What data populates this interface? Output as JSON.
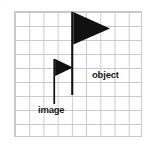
{
  "figure": {
    "background_color": "#ffffff",
    "width": 152,
    "height": 143
  },
  "grid": {
    "name": "graph-paper-grid",
    "columns": 9,
    "rows": 9,
    "cell_width": 14.22,
    "cell_height": 14.0,
    "line_color": "#c9c9c9",
    "origin_x": 14,
    "origin_y": 11
  },
  "shapes": [
    {
      "name": "object-flag",
      "role": "object",
      "fill_color": "#111111",
      "pole_x": 72,
      "pole_top": 12,
      "pole_bottom": 95,
      "pole_width": 2,
      "flag_top": 12,
      "flag_bottom": 44,
      "flag_tip_x": 110,
      "flag_tip_y": 28,
      "size": "large"
    },
    {
      "name": "image-flag",
      "role": "image",
      "fill_color": "#111111",
      "pole_x": 54,
      "pole_top": 59,
      "pole_bottom": 104,
      "pole_width": 1.6,
      "flag_top": 59,
      "flag_bottom": 76,
      "flag_tip_x": 73,
      "flag_tip_y": 67,
      "size": "small"
    }
  ],
  "labels": {
    "object": "object",
    "image": "image",
    "corner_mark": "○"
  },
  "colors": {
    "ink": "#111111",
    "grid_line": "#c9c9c9",
    "text": "#1a1a1a",
    "background": "#ffffff"
  }
}
